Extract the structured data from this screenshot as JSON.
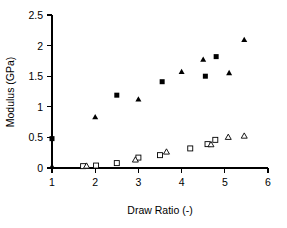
{
  "chart_data": {
    "type": "scatter",
    "title": "",
    "xlabel": "Draw Ratio (-)",
    "ylabel": "Modulus (GPa)",
    "xlim": [
      1,
      6
    ],
    "ylim": [
      0,
      2.5
    ],
    "xticks": [
      "1",
      "2",
      "3",
      "4",
      "5",
      "6"
    ],
    "yticks": [
      "0",
      "0.5",
      "1",
      "1.5",
      "2",
      "2.5"
    ],
    "grid": false,
    "legend": "none",
    "series": [
      {
        "name": "filled-square",
        "marker": "filled square",
        "color": "#000000",
        "points": [
          {
            "x": 1.0,
            "y": 0.48
          },
          {
            "x": 2.5,
            "y": 1.19
          },
          {
            "x": 3.55,
            "y": 1.41
          },
          {
            "x": 4.55,
            "y": 1.5
          },
          {
            "x": 4.8,
            "y": 1.82
          }
        ]
      },
      {
        "name": "filled-triangle",
        "marker": "filled triangle",
        "color": "#000000",
        "points": [
          {
            "x": 1.0,
            "y": 0.02
          },
          {
            "x": 2.0,
            "y": 0.83
          },
          {
            "x": 3.0,
            "y": 1.12
          },
          {
            "x": 4.0,
            "y": 1.57
          },
          {
            "x": 4.5,
            "y": 1.77
          },
          {
            "x": 5.1,
            "y": 1.55
          },
          {
            "x": 5.45,
            "y": 2.09
          }
        ]
      },
      {
        "name": "open-square",
        "marker": "open square",
        "color": "#000000",
        "points": [
          {
            "x": 1.72,
            "y": 0.03
          },
          {
            "x": 2.02,
            "y": 0.04
          },
          {
            "x": 2.5,
            "y": 0.08
          },
          {
            "x": 3.0,
            "y": 0.17
          },
          {
            "x": 3.5,
            "y": 0.21
          },
          {
            "x": 4.2,
            "y": 0.32
          },
          {
            "x": 4.6,
            "y": 0.39
          },
          {
            "x": 4.78,
            "y": 0.46
          }
        ]
      },
      {
        "name": "open-triangle",
        "marker": "open triangle",
        "color": "#000000",
        "points": [
          {
            "x": 1.8,
            "y": 0.03
          },
          {
            "x": 2.93,
            "y": 0.13
          },
          {
            "x": 3.65,
            "y": 0.26
          },
          {
            "x": 4.68,
            "y": 0.38
          },
          {
            "x": 5.08,
            "y": 0.5
          },
          {
            "x": 5.45,
            "y": 0.52
          }
        ]
      }
    ]
  }
}
